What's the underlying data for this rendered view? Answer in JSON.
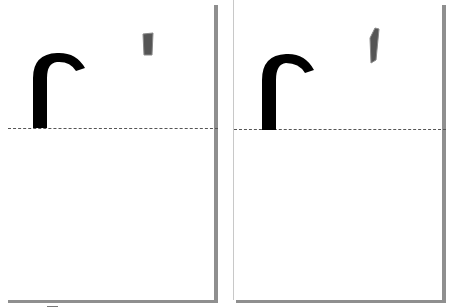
{
  "figure": {
    "panels": [
      {
        "id": "left",
        "glyph": "hooked-r-stroke",
        "mark": "small-grey-rectangle-upright",
        "baseline": "dashed"
      },
      {
        "id": "right",
        "glyph": "hooked-r-stroke",
        "mark": "small-grey-rectangle-slanted",
        "baseline": "dashed"
      }
    ],
    "colors": {
      "glyph": "#000000",
      "mark": "#555555",
      "shadow": "#8f8f8f",
      "baseline": "#555555",
      "page": "#ffffff"
    }
  }
}
